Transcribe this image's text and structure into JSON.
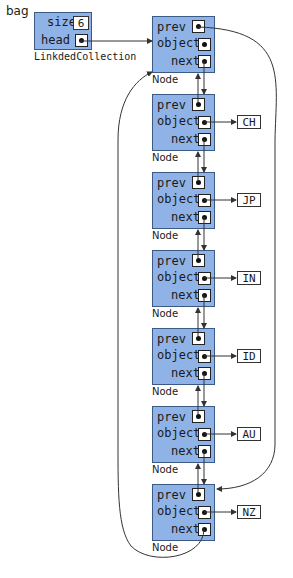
{
  "variable": {
    "name": "bag"
  },
  "collection": {
    "type_label": "LinkdedCollection",
    "fields": {
      "size_label": "size",
      "size_value": "6",
      "head_label": "head"
    }
  },
  "node_fields": {
    "prev": "prev",
    "object": "object",
    "next": "next",
    "type_label": "Node"
  },
  "nodes": [
    {
      "object": null
    },
    {
      "object": "CH"
    },
    {
      "object": "JP"
    },
    {
      "object": "IN"
    },
    {
      "object": "ID"
    },
    {
      "object": "AU"
    },
    {
      "object": "NZ"
    }
  ],
  "colors": {
    "object_fill": "#8fb3e6",
    "object_border": "#3c5a86",
    "line": "#333333"
  }
}
